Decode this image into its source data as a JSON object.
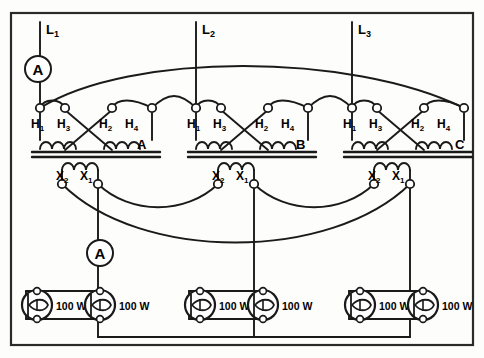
{
  "diagram": {
    "frame": {
      "stroke": "#222222",
      "fill": "#fdfdfb"
    },
    "colors": {
      "wire": "#1a1a1a",
      "text": "#000000",
      "node_fill": "#ffffff",
      "background": "#fdfdfb"
    },
    "supply_lines": [
      {
        "name": "line-l1",
        "label": "L",
        "subscript": "1",
        "x": 40
      },
      {
        "name": "line-l2",
        "label": "L",
        "subscript": "2",
        "x": 196
      },
      {
        "name": "line-l3",
        "label": "L",
        "subscript": "3",
        "x": 352
      }
    ],
    "meters": [
      {
        "name": "ammeter-line-l1",
        "label": "A",
        "cx": 38,
        "cy": 69,
        "r": 13
      },
      {
        "name": "ammeter-secondary-a",
        "label": "A",
        "cx": 100,
        "cy": 253,
        "r": 13
      }
    ],
    "transformers": [
      {
        "name": "transformer-a",
        "designation": "A",
        "designation_x": 140,
        "designation_y": 147,
        "origin_x": 30,
        "primary_terminals": [
          {
            "label": "H",
            "subscript": "1"
          },
          {
            "label": "H",
            "subscript": "3"
          },
          {
            "label": "H",
            "subscript": "2"
          },
          {
            "label": "H",
            "subscript": "4"
          }
        ],
        "secondary_terminals": [
          {
            "label": "X",
            "subscript": "2"
          },
          {
            "label": "X",
            "subscript": "1"
          }
        ]
      },
      {
        "name": "transformer-b",
        "designation": "B",
        "designation_x": 299,
        "designation_y": 147,
        "origin_x": 189,
        "primary_terminals": [
          {
            "label": "H",
            "subscript": "1"
          },
          {
            "label": "H",
            "subscript": "3"
          },
          {
            "label": "H",
            "subscript": "2"
          },
          {
            "label": "H",
            "subscript": "4"
          }
        ],
        "secondary_terminals": [
          {
            "label": "X",
            "subscript": "2"
          },
          {
            "label": "X",
            "subscript": "1"
          }
        ]
      },
      {
        "name": "transformer-c",
        "designation": "C",
        "designation_x": 458,
        "designation_y": 147,
        "origin_x": 345,
        "primary_terminals": [
          {
            "label": "H",
            "subscript": "1"
          },
          {
            "label": "H",
            "subscript": "3"
          },
          {
            "label": "H",
            "subscript": "2"
          },
          {
            "label": "H",
            "subscript": "4"
          }
        ],
        "secondary_terminals": [
          {
            "label": "X",
            "subscript": "2"
          },
          {
            "label": "X",
            "subscript": "1"
          }
        ]
      }
    ],
    "load_groups": [
      {
        "name": "load-group-a",
        "lamps": [
          {
            "name": "lamp-a1",
            "rating": "100 W",
            "cx": 37,
            "cy": 305
          },
          {
            "name": "lamp-a2",
            "rating": "100 W",
            "cx": 100,
            "cy": 305
          }
        ]
      },
      {
        "name": "load-group-b",
        "lamps": [
          {
            "name": "lamp-b1",
            "rating": "100 W",
            "cx": 200,
            "cy": 305
          },
          {
            "name": "lamp-b2",
            "rating": "100 W",
            "cx": 263,
            "cy": 305
          }
        ]
      },
      {
        "name": "load-group-c",
        "lamps": [
          {
            "name": "lamp-c1",
            "rating": "100 W",
            "cx": 360,
            "cy": 305
          },
          {
            "name": "lamp-c2",
            "rating": "100 W",
            "cx": 423,
            "cy": 305
          }
        ]
      }
    ]
  }
}
